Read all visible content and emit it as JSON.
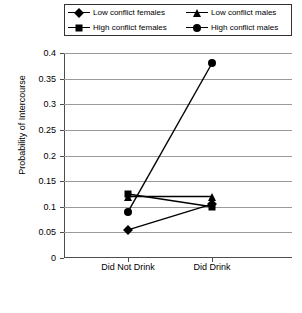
{
  "chart_data": {
    "type": "line",
    "title": "",
    "xlabel": "",
    "ylabel": "Probability of Intercourse",
    "categories": [
      "Did Not Drink",
      "Did Drink"
    ],
    "ylim": [
      0,
      0.4
    ],
    "ytick_labels": [
      "0",
      "0.05",
      "0.1",
      "0.15",
      "0.2",
      "0.25",
      "0.3",
      "0.35",
      "0.4"
    ],
    "ytick_values": [
      0,
      0.05,
      0.1,
      0.15,
      0.2,
      0.25,
      0.3,
      0.35,
      0.4
    ],
    "grid": true,
    "legend_position": "top",
    "series": [
      {
        "name": "Low conflict females",
        "marker": "diamond",
        "values": [
          0.055,
          0.105
        ]
      },
      {
        "name": "High conflict females",
        "marker": "square",
        "values": [
          0.125,
          0.1
        ]
      },
      {
        "name": "Low conflict males",
        "marker": "triangle",
        "values": [
          0.12,
          0.12
        ]
      },
      {
        "name": "High conflict males",
        "marker": "circle",
        "values": [
          0.09,
          0.38
        ]
      }
    ]
  }
}
